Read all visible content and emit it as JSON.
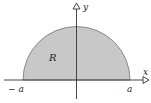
{
  "figure": {
    "type": "region-diagram",
    "region": {
      "label": "R",
      "shape": "semicircle",
      "fill": "#c8c8c8",
      "stroke": "#8a8a8a"
    },
    "axes": {
      "x_label": "x",
      "y_label": "y",
      "color": "#333333"
    },
    "ticks": {
      "left": "− a",
      "right": "a"
    }
  }
}
